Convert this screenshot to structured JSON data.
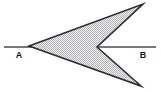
{
  "figure": {
    "canvas": {
      "width": 161,
      "height": 92,
      "background": "#ffffff"
    },
    "axis_line": {
      "name": "line-AB",
      "x1": 4,
      "y1": 47,
      "x2": 156,
      "y2": 47,
      "color": "#4a4a4f",
      "stroke_width": 1.6
    },
    "labels": {
      "left": {
        "text": "A",
        "x": 19,
        "y": 58
      },
      "right": {
        "text": "B",
        "x": 143,
        "y": 58
      }
    },
    "dart": {
      "name": "dart-polygon",
      "points": "29,46 143,4 97,47 141,86",
      "vertices": [
        {
          "id": "A",
          "x": 29,
          "y": 46,
          "role": "left-apex"
        },
        {
          "id": "T",
          "x": 143,
          "y": 4,
          "role": "upper-tip"
        },
        {
          "id": "N",
          "x": 97,
          "y": 47,
          "role": "concave-notch"
        },
        {
          "id": "L",
          "x": 141,
          "y": 86,
          "role": "lower-tip"
        }
      ],
      "fill": "#ececec",
      "stipple_dot_color": "#a8a8ad",
      "stroke": "#2b2b30",
      "stroke_width": 1.6
    }
  }
}
